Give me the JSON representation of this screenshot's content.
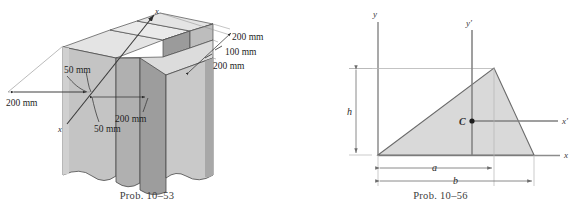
{
  "page": {
    "background": "#ffffff",
    "width": 587,
    "height": 215
  },
  "figures": [
    {
      "id": "prob-10-53",
      "caption": "Prob. 10–53",
      "kind": "isometric-3d-cross-section",
      "description": "Isometric pictorial of a cross (plus) shaped structural member with inclined x axis through the centroid",
      "axis_labels": {
        "x_upper": "x",
        "x_lower": "x"
      },
      "dimensions": [
        {
          "name": "top-right-flange-depth",
          "label": "200 mm"
        },
        {
          "name": "web-thickness-right",
          "label": "100 mm"
        },
        {
          "name": "flange-depth-right",
          "label": "200 mm"
        },
        {
          "name": "flange-width-left",
          "label": "200 mm"
        },
        {
          "name": "web-thickness-top",
          "label": "50 mm"
        },
        {
          "name": "flange-width-mid",
          "label": "200 mm"
        },
        {
          "name": "web-thickness-bottom",
          "label": "50 mm"
        }
      ],
      "colors": {
        "face_top": "#e2e2e2",
        "face_front": "#b9b9b9",
        "face_side": "#a3a3a3",
        "face_light": "#d2d2d2",
        "outline": "#4a4a4a",
        "leader": "#2b2b2b"
      }
    },
    {
      "id": "prob-10-56",
      "caption": "Prob. 10–56",
      "kind": "2d-triangle-centroid",
      "description": "Scalene triangle with base b, inner dimension a to apex, height h, centroid C and centroidal axes x' and y'",
      "axis_labels": {
        "y": "y",
        "x": "x",
        "y_prime": "y′",
        "x_prime": "x′"
      },
      "point_labels": {
        "centroid": "C"
      },
      "dimensions": [
        {
          "name": "height",
          "label": "h"
        },
        {
          "name": "apex-offset",
          "label": "a"
        },
        {
          "name": "base",
          "label": "b"
        }
      ],
      "colors": {
        "fill": "#d9d9d9",
        "outline": "#6b6b6b",
        "axis": "#8c8c8c",
        "centroid_axis": "#7a7a7a",
        "dim": "#8c8c8c",
        "text": "#3a3a3a"
      }
    }
  ]
}
